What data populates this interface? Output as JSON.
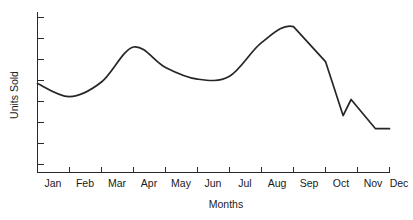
{
  "chart_data": {
    "type": "line",
    "title": "",
    "xlabel": "Months",
    "ylabel": "Units Sold",
    "grid": false,
    "legend": false,
    "categories": [
      "Jan",
      "Feb",
      "Mar",
      "Apr",
      "May",
      "Jun",
      "Jul",
      "Aug",
      "Sep",
      "Oct",
      "Nov",
      "Dec"
    ],
    "series": [
      {
        "name": "Units Sold",
        "values": [
          61,
          52,
          62,
          86,
          72,
          64,
          66,
          89,
          100,
          76,
          44,
          30
        ],
        "color": "#262626"
      }
    ],
    "ylim": [
      0,
      110
    ],
    "xlim": [
      "Jan",
      "Dec"
    ],
    "y_tick_labels": [],
    "y_tick_count": 8,
    "x_tick_labels": [
      "Jan",
      "Feb",
      "Mar",
      "Apr",
      "May",
      "Jun",
      "Jul",
      "Aug",
      "Sep",
      "Oct",
      "Nov",
      "Dec"
    ],
    "annotations": []
  },
  "axes": {
    "y_axis_label": "Units Sold",
    "x_axis_label": "Months"
  }
}
